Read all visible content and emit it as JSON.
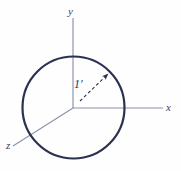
{
  "figure": {
    "type": "coordinate-axes-with-circle",
    "background_color": "#fefefe",
    "axes": {
      "color": "#8b90a8",
      "origin": {
        "x": 73,
        "y": 108
      },
      "items": [
        {
          "name": "y-axis",
          "label": "y",
          "label_x": 68,
          "label_y": 6,
          "x1": 73,
          "y1": 18,
          "x2": 73,
          "y2": 108
        },
        {
          "name": "x-axis",
          "label": "x",
          "label_x": 166,
          "label_y": 102,
          "x1": 73,
          "y1": 108,
          "x2": 163,
          "y2": 108
        },
        {
          "name": "z-axis",
          "label": "z",
          "label_x": 6,
          "label_y": 140,
          "x1": 73,
          "y1": 108,
          "x2": 13,
          "y2": 146
        }
      ]
    },
    "circle": {
      "name": "unit-circle",
      "color": "#2c3152",
      "stroke_width": 2.1,
      "center_x": 73.5,
      "center_y": 107.5,
      "radius": 51
    },
    "radius_arrow": {
      "name": "radius-arrow",
      "color": "#3a3f5c",
      "label": "1′",
      "label_x": 74,
      "label_y": 78,
      "x1": 80,
      "y1": 101,
      "x2": 110,
      "y2": 72,
      "dashed": true
    }
  }
}
